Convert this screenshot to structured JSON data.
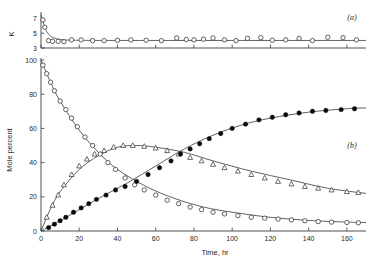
{
  "figure": {
    "panel_a_label": "(a)",
    "panel_b_label": "(b)"
  },
  "chart_data": [
    {
      "type": "scatter",
      "panel": "(a)",
      "title": "",
      "xlabel": "",
      "ylabel": "K",
      "xlim": [
        0,
        170
      ],
      "ylim": [
        3,
        7.6
      ],
      "yticks": [
        3,
        5,
        7
      ],
      "ytick_labels": [
        "3",
        "5",
        "7"
      ],
      "xticks": [
        0,
        20,
        40,
        60,
        80,
        100,
        120,
        140,
        160
      ],
      "grid": false,
      "legend": "none",
      "series": [
        {
          "name": "K (equilibrium constant) data",
          "marker": "open-circle",
          "x": [
            1,
            2,
            4,
            6,
            9,
            12,
            16,
            21,
            27,
            33,
            40,
            47,
            55,
            63,
            71,
            76,
            80,
            85,
            90,
            96,
            102,
            108,
            115,
            121,
            128,
            135,
            142,
            150,
            158,
            165
          ],
          "y": [
            6.8,
            5.8,
            4.0,
            3.9,
            3.9,
            3.85,
            4.1,
            4.1,
            4.0,
            4.0,
            4.05,
            4.1,
            4.05,
            4.0,
            4.35,
            4.15,
            4.1,
            4.2,
            4.35,
            4.1,
            4.0,
            4.3,
            4.4,
            4.05,
            4.1,
            4.3,
            4.0,
            4.45,
            4.4,
            4.1
          ]
        },
        {
          "name": "K fitted curve",
          "marker": "line",
          "x": [
            0,
            1,
            2,
            3,
            5,
            8,
            12,
            18,
            25,
            40,
            60,
            90,
            130,
            170
          ],
          "y": [
            7.5,
            6.6,
            5.8,
            5.2,
            4.6,
            4.25,
            4.1,
            4.05,
            4.03,
            4.02,
            4.02,
            4.02,
            4.02,
            4.02
          ]
        }
      ]
    },
    {
      "type": "scatter",
      "panel": "(b)",
      "title": "",
      "xlabel": "Time, hr",
      "ylabel": "Mole percent",
      "xlim": [
        0,
        170
      ],
      "ylim": [
        0,
        100
      ],
      "yticks": [
        0,
        20,
        40,
        60,
        80,
        100
      ],
      "ytick_labels": [
        "0",
        "20",
        "40",
        "60",
        "80",
        "100"
      ],
      "xticks": [
        0,
        20,
        40,
        60,
        80,
        100,
        120,
        140,
        160
      ],
      "xtick_labels": [
        "0",
        "20",
        "40",
        "60",
        "80",
        "100",
        "120",
        "140",
        "160"
      ],
      "grid": false,
      "legend": "none",
      "series": [
        {
          "name": "Reactant (decaying, open circles)",
          "marker": "open-circle",
          "x": [
            1,
            3,
            5,
            7,
            10,
            13,
            16,
            19,
            23,
            27,
            31,
            35,
            39,
            44,
            49,
            54,
            60,
            66,
            72,
            78,
            84,
            90,
            96,
            103,
            110,
            117,
            124,
            131,
            138,
            145,
            152,
            160,
            166
          ],
          "y": [
            97,
            92,
            87,
            82,
            76,
            71,
            66,
            61,
            55,
            50,
            45,
            40,
            36,
            31,
            27,
            24,
            21,
            18,
            16,
            14,
            12.5,
            11,
            10,
            9,
            8,
            7.5,
            7,
            6.5,
            6,
            5.5,
            5.2,
            5,
            4.8
          ]
        },
        {
          "name": "Reactant fitted curve",
          "marker": "line",
          "x": [
            0,
            5,
            10,
            20,
            30,
            40,
            55,
            70,
            85,
            100,
            120,
            140,
            160,
            170
          ],
          "y": [
            100,
            87,
            76,
            59,
            46,
            36,
            26,
            19,
            14,
            11,
            8,
            6.2,
            5.2,
            5
          ]
        },
        {
          "name": "Intermediate (open triangles)",
          "marker": "open-triangle",
          "x": [
            3,
            6,
            9,
            12,
            16,
            20,
            24,
            28,
            33,
            38,
            43,
            48,
            54,
            60,
            66,
            72,
            78,
            84,
            90,
            96,
            103,
            110,
            117,
            124,
            131,
            138,
            145,
            152,
            160,
            166
          ],
          "y": [
            8,
            15,
            21,
            27,
            33,
            38,
            42,
            45,
            47,
            49,
            50,
            50,
            49.5,
            48.5,
            47,
            45,
            43,
            41,
            39,
            37,
            35,
            33,
            31,
            29,
            27.5,
            26,
            25,
            24,
            23,
            22.5
          ]
        },
        {
          "name": "Intermediate fitted curve",
          "marker": "line",
          "x": [
            0,
            5,
            10,
            20,
            30,
            40,
            50,
            60,
            75,
            90,
            110,
            130,
            150,
            170
          ],
          "y": [
            0,
            13,
            23,
            36,
            44,
            49,
            50,
            49,
            46,
            41,
            35,
            30,
            25,
            22
          ]
        },
        {
          "name": "Product (filled circles)",
          "marker": "filled-circle",
          "x": [
            4,
            7,
            10,
            13,
            17,
            21,
            25,
            29,
            34,
            39,
            44,
            50,
            56,
            62,
            68,
            73,
            78,
            83,
            88,
            94,
            100,
            107,
            114,
            121,
            128,
            135,
            142,
            149,
            157,
            164
          ],
          "y": [
            2,
            4,
            6,
            8,
            11,
            13.5,
            16,
            18.5,
            21,
            24,
            26,
            29,
            33,
            37,
            41,
            45,
            48,
            51,
            54,
            57,
            60,
            62.5,
            65,
            66.5,
            68,
            69,
            70,
            70.5,
            71,
            71.5
          ]
        },
        {
          "name": "Product fitted curve",
          "marker": "line",
          "x": [
            0,
            10,
            20,
            30,
            45,
            60,
            75,
            90,
            105,
            120,
            140,
            160,
            170
          ],
          "y": [
            0,
            6,
            12.5,
            19,
            28,
            38,
            48,
            56,
            62,
            66,
            69.5,
            71.5,
            72
          ]
        }
      ]
    }
  ]
}
